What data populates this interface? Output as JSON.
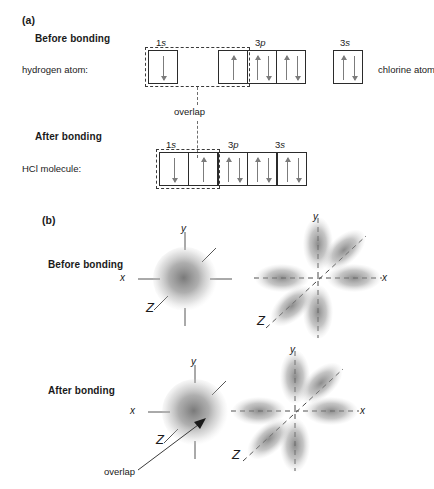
{
  "figure": {
    "panels": [
      {
        "id": "a",
        "label": "(a)"
      },
      {
        "id": "b",
        "label": "(b)"
      }
    ]
  },
  "panel_a": {
    "before": {
      "stage_label": "Before bonding",
      "left_species": "hydrogen atom:",
      "right_species": "chlorine atom",
      "orbital_groups": [
        {
          "name": "1s",
          "label_main": "1",
          "label_italic": "s",
          "boxes": [
            {
              "electrons": [
                "down"
              ]
            }
          ]
        },
        {
          "name": "3p",
          "label_main": "3",
          "label_italic": "p",
          "boxes": [
            {
              "electrons": [
                "up"
              ]
            },
            {
              "electrons": [
                "up",
                "down"
              ]
            },
            {
              "electrons": [
                "up",
                "down"
              ]
            }
          ]
        },
        {
          "name": "3s",
          "label_main": "3",
          "label_italic": "s",
          "boxes": [
            {
              "electrons": [
                "up",
                "down"
              ]
            }
          ]
        }
      ]
    },
    "overlap_caption": "overlap",
    "after": {
      "stage_label": "After bonding",
      "left_species": "HCl molecule:",
      "orbital_groups": [
        {
          "name": "1s",
          "label_main": "1",
          "label_italic": "s",
          "boxes": [
            {
              "electrons": [
                "solo-down"
              ]
            },
            {
              "electrons": [
                "solo-up"
              ]
            }
          ]
        },
        {
          "name": "3p",
          "label_main": "3",
          "label_italic": "p",
          "boxes": [
            {
              "electrons": [
                "up",
                "down"
              ]
            },
            {
              "electrons": [
                "up",
                "down"
              ]
            }
          ]
        },
        {
          "name": "3s",
          "label_main": "3",
          "label_italic": "s",
          "boxes": [
            {
              "electrons": [
                "up",
                "down"
              ]
            }
          ]
        }
      ]
    }
  },
  "panel_b": {
    "before": {
      "stage_label": "Before bonding",
      "hydrogen_orbital": {
        "type": "1s sphere",
        "axes": [
          {
            "name": "x",
            "label": "x"
          },
          {
            "name": "y",
            "label": "y"
          },
          {
            "name": "z",
            "label": "Z"
          }
        ]
      },
      "chlorine_orbital": {
        "type": "3p lobes",
        "axes": [
          {
            "name": "x",
            "label": "x"
          },
          {
            "name": "y",
            "label": "y"
          },
          {
            "name": "z",
            "label": "Z"
          }
        ]
      }
    },
    "after": {
      "stage_label": "After bonding",
      "overlap_caption": "overlap",
      "hydrogen_orbital": {
        "type": "1s sphere",
        "axes": [
          {
            "name": "x",
            "label": "x"
          },
          {
            "name": "y",
            "label": "y"
          },
          {
            "name": "z",
            "label": "Z"
          }
        ]
      },
      "chlorine_orbital": {
        "type": "3p lobes",
        "axes": [
          {
            "name": "x",
            "label": "x"
          },
          {
            "name": "y",
            "label": "y"
          },
          {
            "name": "z",
            "label": "Z"
          }
        ]
      }
    }
  },
  "colors": {
    "background": "#ffffff",
    "text": "#1a1a1a",
    "box_stroke": "#2b2b2b",
    "arrow": "#7c7c7c",
    "dashed": "#3a3a3a",
    "cloud": "#8c8c8c",
    "axis": "#555555"
  }
}
